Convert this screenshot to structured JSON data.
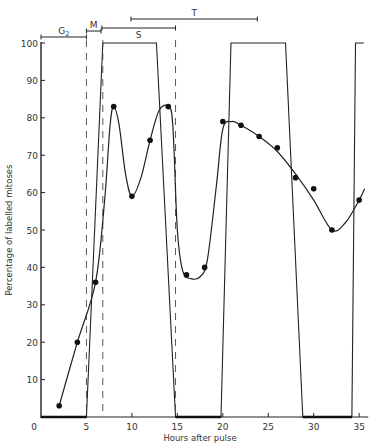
{
  "chart_data": {
    "type": "line",
    "title": "",
    "xlabel": "Hours after pulse",
    "ylabel": "Percentage of labelled mitoses",
    "xlim": [
      0,
      36
    ],
    "ylim": [
      0,
      100
    ],
    "x_ticks": [
      0,
      5,
      10,
      15,
      20,
      25,
      30,
      35
    ],
    "y_ticks": [
      0,
      10,
      20,
      30,
      40,
      50,
      60,
      70,
      80,
      90,
      100
    ],
    "grid": false,
    "legend": null,
    "series": [
      {
        "name": "Observed labelled mitoses",
        "style": "points",
        "x": [
          2,
          4,
          6,
          8,
          10,
          12,
          14,
          16,
          18,
          20,
          22,
          24,
          26,
          28,
          30,
          32,
          35
        ],
        "y": [
          3,
          20,
          36,
          83,
          59,
          74,
          83,
          38,
          40,
          79,
          78,
          75,
          72,
          64,
          61,
          50,
          58
        ]
      },
      {
        "name": "Fitted curve",
        "style": "smooth-line",
        "x": [
          2,
          4,
          6,
          7,
          7.6,
          8,
          8.6,
          9.3,
          10,
          11,
          12,
          13,
          14,
          14.5,
          15,
          15.6,
          16.5,
          17.5,
          18.3,
          19.3,
          20,
          21,
          22,
          24,
          26,
          28,
          30,
          32,
          33.5,
          35,
          35.6
        ],
        "y": [
          3,
          20,
          36,
          58,
          78,
          83,
          78,
          65,
          59,
          64,
          74,
          82,
          83,
          78,
          50,
          39,
          37,
          37.5,
          42,
          62,
          77,
          79,
          78,
          75,
          71,
          65,
          58,
          50,
          52,
          58,
          61
        ]
      },
      {
        "name": "Theoretical (ideal) curve",
        "style": "square-wave",
        "x": [
          0,
          5,
          6.8,
          12.7,
          14.8,
          19.8,
          20.9,
          26.9,
          28.8,
          34.2,
          34.6,
          35.5
        ],
        "y": [
          0,
          0,
          100,
          100,
          0,
          0,
          100,
          100,
          0,
          0,
          100,
          100
        ]
      }
    ],
    "dashed_lines_x": [
      5,
      6.8,
      14.8
    ],
    "phase_brackets": [
      {
        "label": "G",
        "sub": "2",
        "x_start": 0,
        "x_end": 5,
        "y_px": 37
      },
      {
        "label": "M",
        "sub": "",
        "x_start": 5,
        "x_end": 6.6,
        "y_px": 31
      },
      {
        "label": "S",
        "sub": "",
        "x_start": 6.7,
        "x_end": 14.8,
        "y_px": 28
      },
      {
        "label": "T",
        "sub": "",
        "x_start": 9.9,
        "x_end": 23.8,
        "y_px": 19
      }
    ]
  }
}
